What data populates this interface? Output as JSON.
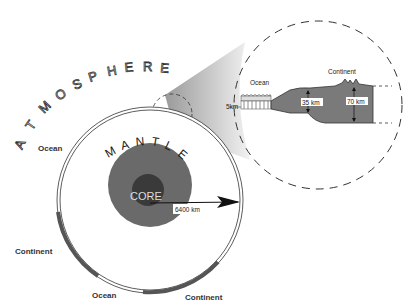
{
  "diagram": {
    "labels": {
      "atmosphere": "ATMOSPHERE",
      "mantle": "MANTLE",
      "core": "CORE",
      "radius": "6400 km",
      "ocean_left": "Ocean",
      "continent_left": "Continent",
      "ocean_bottom": "Ocean",
      "continent_bottom": "Continent"
    },
    "inset": {
      "ocean": "Ocean",
      "continent": "Continent",
      "ocean_crust": "5km",
      "continent_mid": "35 km",
      "continent_max": "70 km"
    },
    "atmosphere_letters": [
      "A",
      "T",
      "M",
      "O",
      "S",
      "P",
      "H",
      "E",
      "R",
      "E"
    ],
    "mantle_letters": [
      "M",
      "A",
      "N",
      "T",
      "L",
      "E"
    ],
    "colors": {
      "crust": "#555555",
      "outer_core": "#6a6a6a",
      "inner_core": "#3a3a3a",
      "cone": "#bdbdbd"
    }
  }
}
